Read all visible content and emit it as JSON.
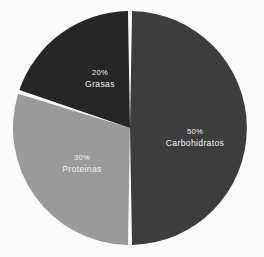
{
  "chart_data": {
    "type": "pie",
    "title": "",
    "subtitle": "",
    "xlabel": "",
    "ylabel": "",
    "legend": "none",
    "grid": false,
    "background_color": "#fcfcfc",
    "label_text_color": "#f2f2f2",
    "slice_gap_color": "#fcfcfc",
    "total": 100,
    "units": "%",
    "categories": [
      "Carbohidratos",
      "Proteinas",
      "Grasas"
    ],
    "values": [
      50,
      30,
      20
    ],
    "colors": [
      "#3d3d3d",
      "#9a9a9a",
      "#262626"
    ],
    "geometry": {
      "center_x": 130,
      "center_y": 128,
      "radius": 117,
      "start_angle_deg": 0,
      "direction": "clockwise",
      "gap_deg": 2.0
    },
    "slices": [
      {
        "name": "Carbohidratos",
        "value": 50,
        "percent_label": "50%",
        "name_label": "Carbohidratos",
        "color": "#3d3d3d",
        "start_angle_deg": 0,
        "end_angle_deg": 180,
        "label_x": 195,
        "label_y": 134
      },
      {
        "name": "Proteinas",
        "value": 30,
        "percent_label": "30%",
        "name_label": "Proteinas",
        "color": "#9a9a9a",
        "start_angle_deg": 180,
        "end_angle_deg": 288,
        "label_x": 82,
        "label_y": 160
      },
      {
        "name": "Grasas",
        "value": 20,
        "percent_label": "20%",
        "name_label": "Grasas",
        "color": "#262626",
        "start_angle_deg": 288,
        "end_angle_deg": 360,
        "label_x": 100,
        "label_y": 75
      }
    ]
  }
}
